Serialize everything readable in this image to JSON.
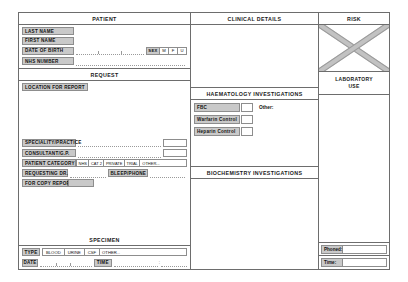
{
  "form": {
    "patient": {
      "header": "PATIENT",
      "fields": [
        {
          "label": "LAST NAME",
          "value": ""
        },
        {
          "label": "FIRST NAME",
          "value": ""
        },
        {
          "label": "DATE OF BIRTH",
          "value": ""
        },
        {
          "label": "NHS NUMBER",
          "value": ""
        }
      ],
      "sex": {
        "label": "SEX",
        "options": [
          "M",
          "F",
          "U"
        ]
      }
    },
    "request": {
      "header": "REQUEST",
      "location_label": "LOCATION FOR REPORT",
      "speciality_label": "SPECIALITY/PRACTICE",
      "consultant_label": "CONSULTANT/G.P.",
      "category_label": "PATIENT CATEGORY",
      "category_options": [
        "NHS",
        "CAT 2",
        "PRIVATE",
        "TRIAL",
        "OTHER..."
      ],
      "requesting_dr_label": "REQUESTING DR.",
      "bleep_label": "BLEEP/PHONE",
      "copy_report_label": "FOR COPY REPORT"
    },
    "specimen": {
      "header": "SPECIMEN",
      "type_label": "TYPE",
      "type_options": [
        "BLOOD",
        "URINE",
        "CSF",
        "OTHER..."
      ],
      "date_label": "DATE",
      "time_label": "TIME",
      "time_separator": ":"
    },
    "clinical": {
      "header": "CLINICAL DETAILS",
      "notes": ""
    },
    "haematology": {
      "header": "HAEMATOLOGY INVESTIGATIONS",
      "tests": [
        {
          "label": "FBC",
          "checked": ""
        },
        {
          "label": "Warfarin Control",
          "checked": ""
        },
        {
          "label": "Heparin Control",
          "checked": ""
        }
      ],
      "other_label": "Other:"
    },
    "biochemistry": {
      "header": "BIOCHEMISTRY INVESTIGATIONS",
      "notes": ""
    },
    "risk": {
      "header": "RISK",
      "mark": "x-cross",
      "lab_use_line1": "LABORATORY",
      "lab_use_line2": "USE",
      "phoned_label": "Phoned:",
      "phoned_value": "",
      "time_label": "Time:",
      "time_value": ""
    }
  },
  "colors": {
    "label_fill": "#c9c9c9",
    "border": "#6d6d6d",
    "field_border": "#8d8d8d",
    "dotted_rule": "#9a9a9a",
    "text": "#1a1a1a",
    "paper": "#ffffff"
  }
}
